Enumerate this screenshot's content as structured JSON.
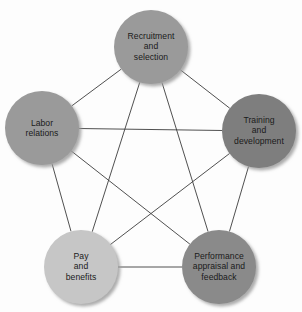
{
  "diagram": {
    "type": "pentagon-network",
    "background_color": "#fdfdfd",
    "edge_color": "#3c3c3c",
    "label_color": "#1a1a1a",
    "shadow_color": "#b4b4b4",
    "nodes": [
      {
        "id": "recruitment",
        "label": "Recruitment and selection",
        "lines": [
          "Recruitment",
          "and",
          "selection"
        ],
        "cx": 151,
        "cy": 47,
        "r": 37,
        "fill": "#9a9a9a"
      },
      {
        "id": "labor-relations",
        "label": "Labor relations",
        "lines": [
          "Labor",
          "relations"
        ],
        "cx": 42,
        "cy": 128,
        "r": 37,
        "fill": "#9a9a9a"
      },
      {
        "id": "training",
        "label": "Training and development",
        "lines": [
          "Training",
          "and",
          "development"
        ],
        "cx": 259,
        "cy": 131,
        "r": 37,
        "fill": "#7e7e7e"
      },
      {
        "id": "pay-benefits",
        "label": "Pay and benefits",
        "lines": [
          "Pay",
          "and",
          "benefits"
        ],
        "cx": 81,
        "cy": 267,
        "r": 37,
        "fill": "#c6c6c6"
      },
      {
        "id": "performance",
        "label": "Performance appraisal and feedback",
        "lines": [
          "Performance",
          "appraisal and",
          "feedback"
        ],
        "cx": 219,
        "cy": 267,
        "r": 37,
        "fill": "#8a8a8a"
      }
    ],
    "edges": [
      {
        "from": "recruitment",
        "to": "labor-relations"
      },
      {
        "from": "recruitment",
        "to": "training"
      },
      {
        "from": "recruitment",
        "to": "pay-benefits"
      },
      {
        "from": "recruitment",
        "to": "performance"
      },
      {
        "from": "labor-relations",
        "to": "training"
      },
      {
        "from": "labor-relations",
        "to": "pay-benefits"
      },
      {
        "from": "labor-relations",
        "to": "performance"
      },
      {
        "from": "training",
        "to": "pay-benefits"
      },
      {
        "from": "training",
        "to": "performance"
      },
      {
        "from": "pay-benefits",
        "to": "performance"
      }
    ]
  }
}
